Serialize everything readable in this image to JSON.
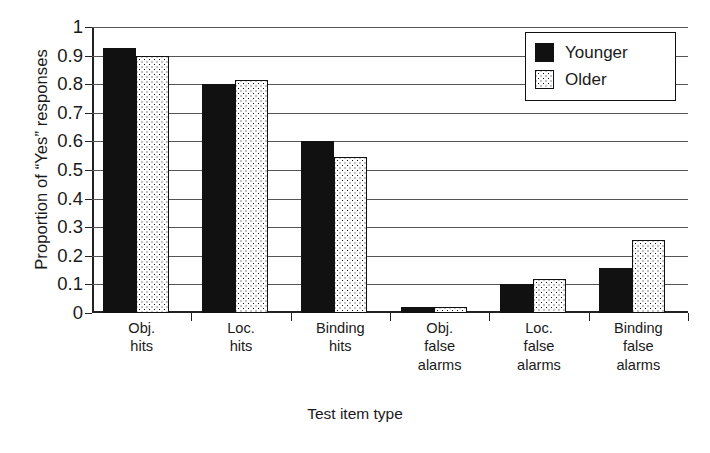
{
  "chart_data": {
    "type": "bar",
    "title": "",
    "xlabel": "Test item type",
    "ylabel": "Proportion of “Yes” responses",
    "ylim": [
      0,
      1
    ],
    "ytick_labels": [
      "0",
      "0.1",
      "0.2",
      "0.3",
      "0.4",
      "0.5",
      "0.6",
      "0.7",
      "0.8",
      "0.9",
      "1"
    ],
    "ytick_values": [
      0,
      0.1,
      0.2,
      0.3,
      0.4,
      0.5,
      0.6,
      0.7,
      0.8,
      0.9,
      1
    ],
    "grid": true,
    "legend_position": "top-right",
    "categories": [
      "Obj.\nhits",
      "Loc.\nhits",
      "Binding\nhits",
      "Obj.\nfalse\nalarms",
      "Loc.\nfalse\nalarms",
      "Binding\nfalse\nalarms"
    ],
    "series": [
      {
        "name": "Younger",
        "color": "#111111",
        "fill": "solid-black",
        "values": [
          0.925,
          0.8,
          0.6,
          0.022,
          0.103,
          0.157
        ]
      },
      {
        "name": "Older",
        "color": "#ffffff",
        "fill": "dotted-white",
        "values": [
          0.9,
          0.815,
          0.545,
          0.02,
          0.118,
          0.255
        ]
      }
    ]
  },
  "legend": {
    "entries": [
      {
        "label": "Younger"
      },
      {
        "label": "Older"
      }
    ]
  }
}
